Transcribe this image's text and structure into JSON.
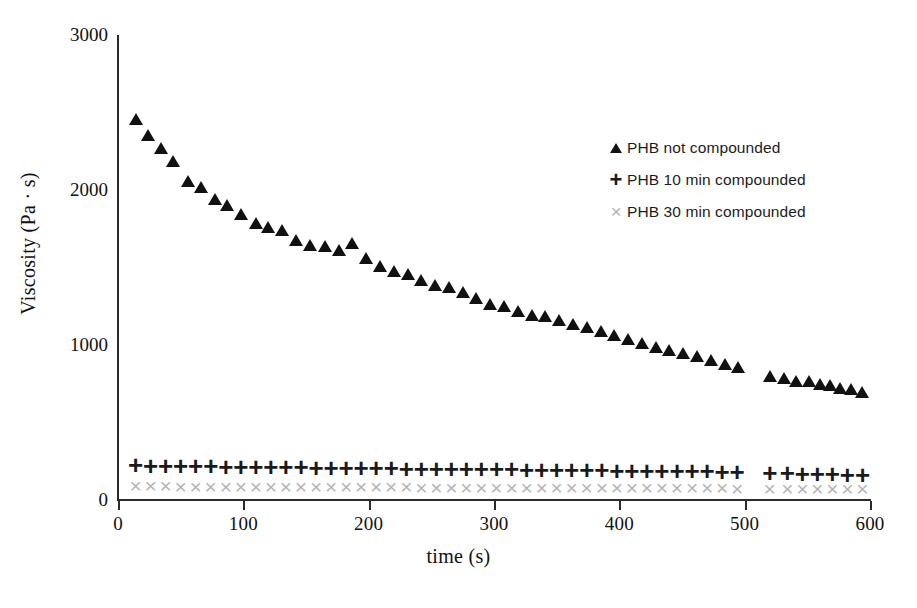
{
  "chart_data": {
    "type": "scatter",
    "title": "",
    "xlabel": "time (s)",
    "ylabel": "Viscosity (Pa · s)",
    "xlim": [
      0,
      600
    ],
    "ylim": [
      0,
      3000
    ],
    "xticks": [
      0,
      100,
      200,
      300,
      400,
      500,
      600
    ],
    "yticks": [
      0,
      1000,
      2000,
      3000
    ],
    "grid": false,
    "legend_position": "upper right",
    "series": [
      {
        "name": "PHB not compounded",
        "marker": "triangle",
        "color": "#111111",
        "points": [
          [
            14,
            2460
          ],
          [
            24,
            2355
          ],
          [
            34,
            2270
          ],
          [
            44,
            2190
          ],
          [
            56,
            2060
          ],
          [
            66,
            2020
          ],
          [
            77,
            1945
          ],
          [
            87,
            1905
          ],
          [
            98,
            1845
          ],
          [
            110,
            1790
          ],
          [
            120,
            1760
          ],
          [
            131,
            1740
          ],
          [
            142,
            1680
          ],
          [
            153,
            1645
          ],
          [
            165,
            1640
          ],
          [
            176,
            1610
          ],
          [
            187,
            1660
          ],
          [
            198,
            1560
          ],
          [
            209,
            1510
          ],
          [
            220,
            1480
          ],
          [
            231,
            1455
          ],
          [
            242,
            1420
          ],
          [
            253,
            1390
          ],
          [
            264,
            1375
          ],
          [
            275,
            1340
          ],
          [
            286,
            1305
          ],
          [
            297,
            1265
          ],
          [
            308,
            1250
          ],
          [
            319,
            1220
          ],
          [
            330,
            1195
          ],
          [
            341,
            1185
          ],
          [
            352,
            1160
          ],
          [
            363,
            1135
          ],
          [
            374,
            1115
          ],
          [
            385,
            1090
          ],
          [
            396,
            1065
          ],
          [
            407,
            1040
          ],
          [
            418,
            1010
          ],
          [
            429,
            990
          ],
          [
            440,
            970
          ],
          [
            451,
            950
          ],
          [
            462,
            930
          ],
          [
            473,
            905
          ],
          [
            484,
            880
          ],
          [
            495,
            860
          ],
          [
            520,
            800
          ],
          [
            531,
            785
          ],
          [
            541,
            770
          ],
          [
            551,
            765
          ],
          [
            560,
            750
          ],
          [
            568,
            740
          ],
          [
            576,
            725
          ],
          [
            585,
            715
          ],
          [
            594,
            700
          ]
        ]
      },
      {
        "name": "PHB 10 min compounded",
        "marker": "plus",
        "color": "#1a1a1a",
        "points": [
          [
            14,
            225
          ],
          [
            26,
            222
          ],
          [
            38,
            220
          ],
          [
            50,
            218
          ],
          [
            62,
            222
          ],
          [
            74,
            218
          ],
          [
            86,
            215
          ],
          [
            98,
            215
          ],
          [
            110,
            212
          ],
          [
            122,
            212
          ],
          [
            134,
            210
          ],
          [
            146,
            210
          ],
          [
            158,
            208
          ],
          [
            170,
            208
          ],
          [
            182,
            206
          ],
          [
            194,
            206
          ],
          [
            206,
            205
          ],
          [
            218,
            204
          ],
          [
            230,
            203
          ],
          [
            242,
            202
          ],
          [
            254,
            202
          ],
          [
            266,
            200
          ],
          [
            278,
            200
          ],
          [
            290,
            198
          ],
          [
            302,
            198
          ],
          [
            314,
            197
          ],
          [
            326,
            196
          ],
          [
            338,
            195
          ],
          [
            350,
            194
          ],
          [
            362,
            193
          ],
          [
            374,
            192
          ],
          [
            386,
            191
          ],
          [
            398,
            190
          ],
          [
            410,
            189
          ],
          [
            422,
            188
          ],
          [
            434,
            187
          ],
          [
            446,
            186
          ],
          [
            458,
            185
          ],
          [
            470,
            184
          ],
          [
            482,
            183
          ],
          [
            494,
            182
          ],
          [
            520,
            175
          ],
          [
            534,
            172
          ],
          [
            546,
            170
          ],
          [
            558,
            168
          ],
          [
            570,
            166
          ],
          [
            582,
            164
          ],
          [
            594,
            162
          ]
        ]
      },
      {
        "name": "PHB 30 min compounded",
        "marker": "cross",
        "color": "#b4b4b4",
        "points": [
          [
            14,
            95
          ],
          [
            26,
            94
          ],
          [
            38,
            94
          ],
          [
            50,
            93
          ],
          [
            62,
            93
          ],
          [
            74,
            92
          ],
          [
            86,
            92
          ],
          [
            98,
            92
          ],
          [
            110,
            91
          ],
          [
            122,
            91
          ],
          [
            134,
            90
          ],
          [
            146,
            90
          ],
          [
            158,
            90
          ],
          [
            170,
            89
          ],
          [
            182,
            89
          ],
          [
            194,
            89
          ],
          [
            206,
            88
          ],
          [
            218,
            88
          ],
          [
            230,
            88
          ],
          [
            242,
            87
          ],
          [
            254,
            87
          ],
          [
            266,
            87
          ],
          [
            278,
            86
          ],
          [
            290,
            86
          ],
          [
            302,
            86
          ],
          [
            314,
            85
          ],
          [
            326,
            85
          ],
          [
            338,
            85
          ],
          [
            350,
            84
          ],
          [
            362,
            84
          ],
          [
            374,
            84
          ],
          [
            386,
            83
          ],
          [
            398,
            83
          ],
          [
            410,
            83
          ],
          [
            422,
            82
          ],
          [
            434,
            82
          ],
          [
            446,
            82
          ],
          [
            458,
            81
          ],
          [
            470,
            81
          ],
          [
            482,
            81
          ],
          [
            494,
            80
          ],
          [
            520,
            78
          ],
          [
            534,
            77
          ],
          [
            546,
            77
          ],
          [
            558,
            76
          ],
          [
            570,
            76
          ],
          [
            582,
            75
          ],
          [
            594,
            75
          ]
        ]
      }
    ]
  },
  "axes": {
    "y_title": "Viscosity (Pa · s)",
    "x_title": "time (s)",
    "y_tick_labels": [
      "3000",
      "2000",
      "1000",
      "0"
    ],
    "x_tick_labels": [
      "0",
      "100",
      "200",
      "300",
      "400",
      "500",
      "600"
    ]
  },
  "legend": {
    "items": [
      {
        "label": "PHB not compounded",
        "marker": "triangle"
      },
      {
        "label": "PHB 10 min compounded",
        "marker": "plus"
      },
      {
        "label": "PHB 30 min compounded",
        "marker": "cross"
      }
    ]
  },
  "colors": {
    "series_1": "#111111",
    "series_2": "#1a1a1a",
    "series_3": "#b4b4b4",
    "axis": "#2b2b2b",
    "background": "#ffffff"
  }
}
